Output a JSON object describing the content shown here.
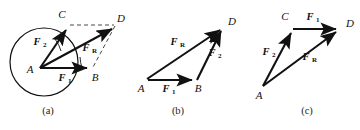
{
  "figure": {
    "background_color": "#ffffff",
    "ink_color": "#111111",
    "construction_color": "#333333"
  },
  "panels": [
    {
      "id": "a",
      "caption": "(a)",
      "description": "Parallelogram law with circle of action at point A",
      "points": [
        {
          "name": "A",
          "label": "A"
        },
        {
          "name": "B",
          "label": "B"
        },
        {
          "name": "C",
          "label": "C"
        },
        {
          "name": "D",
          "label": "D"
        }
      ],
      "vectors": [
        {
          "name": "F1",
          "symbol": "F",
          "subscript": "1",
          "from": "A",
          "to": "B"
        },
        {
          "name": "F2",
          "symbol": "F",
          "subscript": "2",
          "from": "A",
          "to": "C"
        },
        {
          "name": "FR",
          "symbol": "F",
          "subscript": "R",
          "from": "A",
          "to": "D"
        }
      ],
      "construction_lines": [
        {
          "from": "C",
          "to": "D",
          "style": "dashed"
        },
        {
          "from": "B",
          "to": "D",
          "style": "dashed"
        }
      ],
      "has_circle": true
    },
    {
      "id": "b",
      "caption": "(b)",
      "description": "Triangle rule, head-to-tail F1 then F2",
      "points": [
        {
          "name": "A",
          "label": "A"
        },
        {
          "name": "B",
          "label": "B"
        },
        {
          "name": "D",
          "label": "D"
        }
      ],
      "vectors": [
        {
          "name": "F1",
          "symbol": "F",
          "subscript": "1",
          "from": "A",
          "to": "B"
        },
        {
          "name": "F2",
          "symbol": "F",
          "subscript": "2",
          "from": "B",
          "to": "D"
        },
        {
          "name": "FR",
          "symbol": "F",
          "subscript": "R",
          "from": "A",
          "to": "D"
        }
      ],
      "construction_lines": [],
      "has_circle": false
    },
    {
      "id": "c",
      "caption": "(c)",
      "description": "Triangle rule, head-to-tail F2 then F1",
      "points": [
        {
          "name": "A",
          "label": "A"
        },
        {
          "name": "C",
          "label": "C"
        },
        {
          "name": "D",
          "label": "D"
        }
      ],
      "vectors": [
        {
          "name": "F2",
          "symbol": "F",
          "subscript": "2",
          "from": "A",
          "to": "C"
        },
        {
          "name": "F1",
          "symbol": "F",
          "subscript": "1",
          "from": "C",
          "to": "D"
        },
        {
          "name": "FR",
          "symbol": "F",
          "subscript": "R",
          "from": "A",
          "to": "D"
        }
      ],
      "construction_lines": [],
      "has_circle": false
    }
  ],
  "labels": {
    "panel_a": {
      "point_A": "A",
      "point_B": "B",
      "point_C": "C",
      "point_D": "D",
      "F1_symbol": "F",
      "F1_sub": "1",
      "F2_symbol": "F",
      "F2_sub": "2",
      "FR_symbol": "F",
      "FR_sub": "R",
      "caption": "(a)"
    },
    "panel_b": {
      "point_A": "A",
      "point_B": "B",
      "point_D": "D",
      "F1_symbol": "F",
      "F1_sub": "1",
      "F2_symbol": "F",
      "F2_sub": "2",
      "FR_symbol": "F",
      "FR_sub": "R",
      "caption": "(b)"
    },
    "panel_c": {
      "point_A": "A",
      "point_C": "C",
      "point_D": "D",
      "F1_symbol": "F",
      "F1_sub": "1",
      "F2_symbol": "F",
      "F2_sub": "2",
      "FR_symbol": "F",
      "FR_sub": "R",
      "caption": "(c)"
    }
  }
}
